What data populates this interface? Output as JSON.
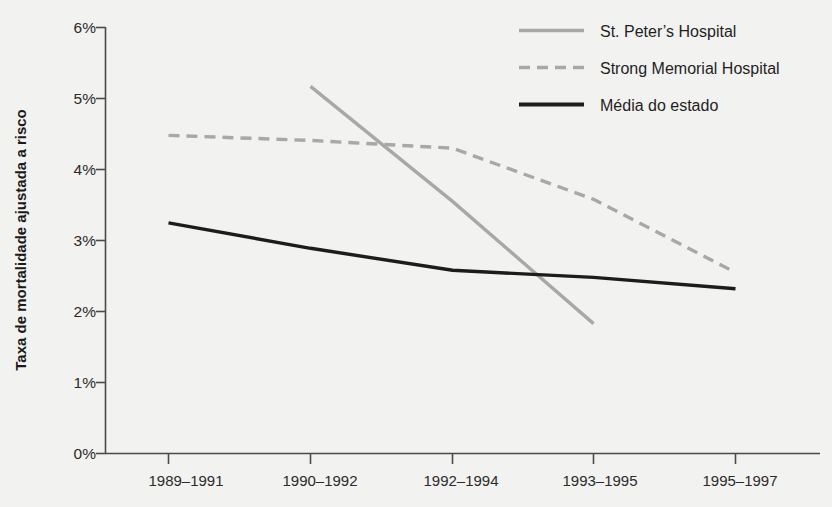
{
  "chart_data": {
    "type": "line",
    "title": "",
    "xlabel": "",
    "ylabel": "Taxa de mortalidade ajustada a risco",
    "categories": [
      "1989–1991",
      "1990–1992",
      "1992–1994",
      "1993–1995",
      "1995–1997"
    ],
    "ylim": [
      0,
      6
    ],
    "ytick_labels": [
      "0%",
      "1%",
      "2%",
      "3%",
      "4%",
      "5%",
      "6%"
    ],
    "ytick_values": [
      0,
      1,
      2,
      3,
      4,
      5,
      6
    ],
    "grid": false,
    "legend_position": "top-right",
    "series": [
      {
        "name": "St. Peter's Hospital",
        "style": "solid",
        "color": "#a8a8a8",
        "width": 3.4,
        "values": [
          null,
          5.17,
          3.55,
          1.83,
          null
        ]
      },
      {
        "name": "Strong Memorial Hospital",
        "style": "dashed",
        "color": "#a8a8a8",
        "width": 3.4,
        "values": [
          4.48,
          4.41,
          4.3,
          3.58,
          2.55
        ]
      },
      {
        "name": "Média do estado",
        "style": "solid",
        "color": "#1c1c1c",
        "width": 3.4,
        "values": [
          3.25,
          2.89,
          2.58,
          2.48,
          2.32
        ]
      }
    ]
  },
  "legend": {
    "items": [
      {
        "label": "St. Peter’s Hospital"
      },
      {
        "label": "Strong Memorial Hospital"
      },
      {
        "label": "Média do estado"
      }
    ]
  },
  "axes": {
    "y_title": "Taxa de mortalidade ajustada a risco"
  },
  "colors": {
    "background": "#f2f2f0",
    "gray_series": "#a8a8a8",
    "black_series": "#1c1c1c",
    "axis": "#4a4a4a",
    "text": "#2b2b2b"
  }
}
